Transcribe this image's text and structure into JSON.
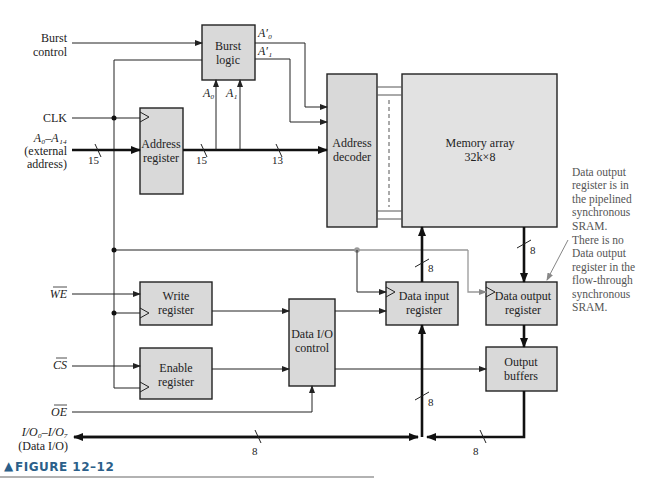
{
  "diagram": {
    "caption": {
      "marker": "▲",
      "text": "FIGURE 12–12"
    },
    "inputs": {
      "burst_control": [
        "Burst",
        "control"
      ],
      "clk": "CLK",
      "address": [
        "A₀–A₁₄",
        "(external",
        "address)"
      ],
      "we": "WE",
      "cs": "CS",
      "oe": "OE",
      "data_io": [
        "I/O₀–I/O₇",
        "(Data I/O)"
      ]
    },
    "blocks": {
      "burst_logic": [
        "Burst",
        "logic"
      ],
      "address_register": [
        "Address",
        "register"
      ],
      "address_decoder": [
        "Address",
        "decoder"
      ],
      "memory_array": [
        "Memory array",
        "32k×8"
      ],
      "write_register": [
        "Write",
        "register"
      ],
      "enable_register": [
        "Enable",
        "register"
      ],
      "data_io_control": [
        "Data I/O",
        "control"
      ],
      "data_input_register": [
        "Data input",
        "register"
      ],
      "data_output_register": [
        "Data output",
        "register"
      ],
      "output_buffers": [
        "Output",
        "buffers"
      ]
    },
    "signal_labels": {
      "a0": "A₀",
      "a1": "A₁",
      "a0_prime": "A′₀",
      "a1_prime": "A′₁"
    },
    "bus_widths": {
      "address_in": "15",
      "address_reg_out": "15",
      "decoder_in": "13",
      "memory_out": "8",
      "data_in_reg_out": "8",
      "data_in_reg_in": "8",
      "data_io_bus": "8",
      "output_buffer_out": "8"
    },
    "annotation": [
      "Data output",
      "register is in",
      "the pipelined",
      "synchronous",
      "SRAM.",
      "There is no",
      "Data output",
      "register in the",
      "flow-through",
      "synchronous",
      "SRAM."
    ]
  }
}
